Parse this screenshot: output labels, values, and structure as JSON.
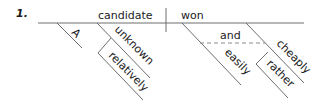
{
  "exercise": {
    "number": "1.",
    "subject": "candidate",
    "verb": "won",
    "subject_modifiers": {
      "article": "A",
      "adjective": "unknown",
      "adverb_on_adjective": "relatively"
    },
    "verb_modifiers": {
      "conjunction": "and",
      "adverb_left": "easily",
      "adverb_right": "cheaply",
      "adverb_on_right": "rather"
    }
  }
}
